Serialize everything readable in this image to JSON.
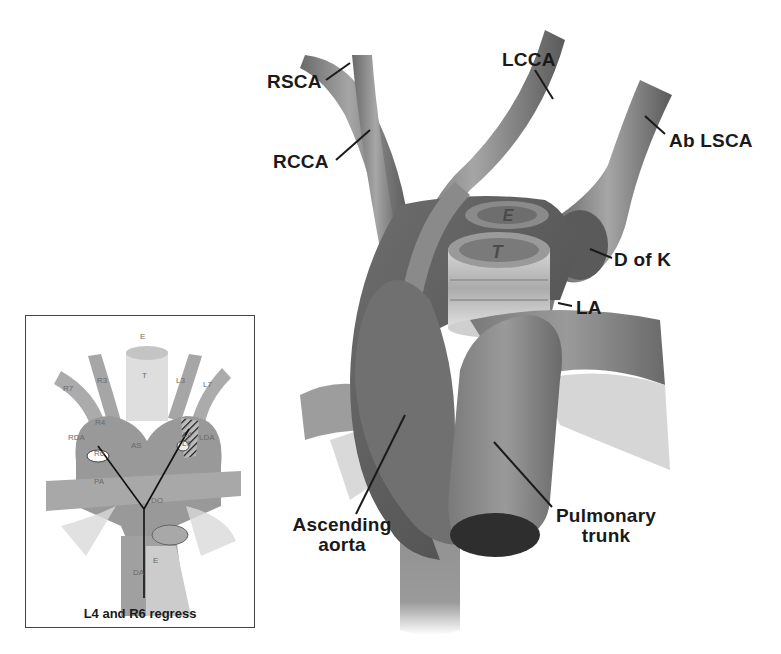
{
  "main_diagram": {
    "labels": {
      "rsca": "RSCA",
      "rcca": "RCCA",
      "lcca": "LCCA",
      "ab_lsca": "Ab LSCA",
      "d_of_k": "D of K",
      "la": "LA",
      "ascending_aorta_line1": "Ascending",
      "ascending_aorta_line2": "aorta",
      "pulmonary_trunk_line1": "Pulmonary",
      "pulmonary_trunk_line2": "trunk",
      "esophagus": "E",
      "trachea": "T"
    }
  },
  "inset_diagram": {
    "labels": {
      "e_top": "E",
      "t": "T",
      "r7": "R7",
      "r3": "R3",
      "l3": "L3",
      "l7": "L7",
      "r4": "R4",
      "l4": "L4",
      "rda": "RDA",
      "lda": "LDA",
      "as": "AS",
      "r6": "R6",
      "l6": "L6",
      "pa": "PA",
      "do": "DO",
      "e_bottom": "E",
      "da": "DA"
    },
    "caption": "L4 and R6 regress"
  },
  "colors": {
    "vessel_dark": "#5e5e5e",
    "vessel_mid": "#8a8a8a",
    "vessel_light": "#b8b8b8",
    "label_text": "#1a1a1a",
    "leader_line": "#1a1a1a",
    "inset_border": "#444444"
  }
}
